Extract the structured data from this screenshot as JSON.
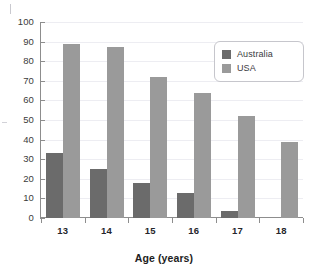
{
  "chart_data": {
    "type": "bar",
    "title": "",
    "subtitle": "",
    "xlabel": "Age (years)",
    "ylabel": "",
    "categories": [
      "13",
      "14",
      "15",
      "16",
      "17",
      "18"
    ],
    "series": [
      {
        "name": "Australia",
        "color": "#6b6b6b",
        "values": [
          33,
          25,
          18,
          13,
          3.5,
          0
        ]
      },
      {
        "name": "USA",
        "color": "#9a9a9a",
        "values": [
          89,
          87,
          72,
          64,
          52,
          39
        ]
      }
    ],
    "ylim": [
      0,
      100
    ],
    "ytick_step": 10,
    "yticks": [
      "0",
      "10",
      "20",
      "30",
      "40",
      "50",
      "60",
      "70",
      "80",
      "90",
      "100"
    ],
    "grid": true,
    "grid_axis": "y",
    "legend_position": "top-right",
    "legend_entries": [
      "Australia",
      "USA"
    ]
  },
  "axes": {
    "x_title": "Age (years)"
  },
  "legend": {
    "items": [
      {
        "label": "Australia",
        "swatch": "#6b6b6b"
      },
      {
        "label": "USA",
        "swatch": "#9a9a9a"
      }
    ]
  },
  "colors": {
    "australia": "#6b6b6b",
    "usa": "#9a9a9a",
    "axis": "#8d8d8d",
    "grid": "#ededf2",
    "legend_border": "#c6c6cc",
    "background": "#ffffff"
  }
}
